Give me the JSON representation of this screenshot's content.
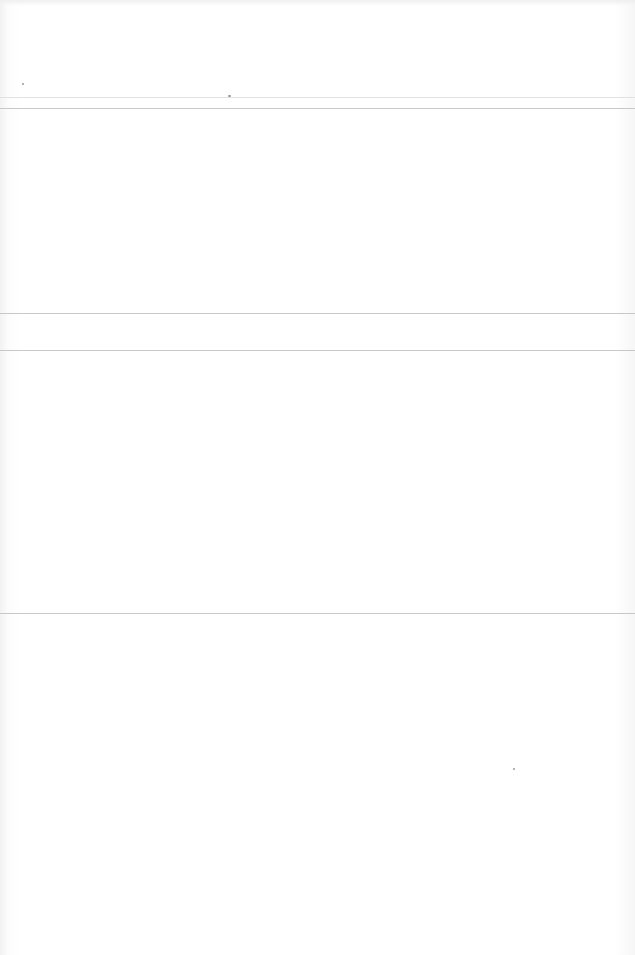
{
  "page": {
    "type": "blank-ruled-page",
    "rules": [
      {
        "y": 97,
        "style": "faint"
      },
      {
        "y": 108,
        "style": "normal"
      },
      {
        "y": 313,
        "style": "normal"
      },
      {
        "y": 350,
        "style": "normal"
      },
      {
        "y": 613,
        "style": "normal"
      }
    ],
    "colors": {
      "paper": "#ffffff",
      "rule": "#c8c8c8",
      "rule_faint": "#e2e2e2"
    }
  }
}
